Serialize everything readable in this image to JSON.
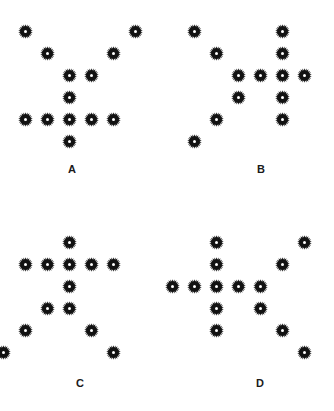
{
  "figure": {
    "background_color": "#ffffff",
    "marker_color": "#121212",
    "marker_center_color": "#ffffff",
    "marker_icon_name": "starburst-marker-icon",
    "width": 334,
    "height": 411,
    "grid_spacing": 22,
    "marker_size": 15
  },
  "chart_data": {
    "type": "scatter",
    "title": "",
    "xlabel": "",
    "ylabel": "",
    "grid": false,
    "legend": null,
    "note": "Four panels of starburst markers arranged on a regular grid; each panel forms an arrow/cross-like figure. Coordinates are grid column/row indices (col increases rightward, row increases downward).",
    "panels": [
      {
        "label": "A",
        "origin": {
          "x": 25,
          "y": 31
        },
        "spacing": 22,
        "label_pos": {
          "x": 72,
          "y": 163
        },
        "points": [
          {
            "col": 0,
            "row": 0
          },
          {
            "col": 5,
            "row": 0
          },
          {
            "col": 1,
            "row": 1
          },
          {
            "col": 4,
            "row": 1
          },
          {
            "col": 2,
            "row": 2
          },
          {
            "col": 3,
            "row": 2
          },
          {
            "col": 2,
            "row": 3
          },
          {
            "col": 0,
            "row": 4
          },
          {
            "col": 1,
            "row": 4
          },
          {
            "col": 2,
            "row": 4
          },
          {
            "col": 3,
            "row": 4
          },
          {
            "col": 4,
            "row": 4
          },
          {
            "col": 2,
            "row": 5
          }
        ]
      },
      {
        "label": "B",
        "origin": {
          "x": 194,
          "y": 31
        },
        "spacing": 22,
        "label_pos": {
          "x": 261,
          "y": 163
        },
        "points": [
          {
            "col": 0,
            "row": 0
          },
          {
            "col": 4,
            "row": 0
          },
          {
            "col": 1,
            "row": 1
          },
          {
            "col": 4,
            "row": 1
          },
          {
            "col": 2,
            "row": 2
          },
          {
            "col": 3,
            "row": 2
          },
          {
            "col": 4,
            "row": 2
          },
          {
            "col": 5,
            "row": 2
          },
          {
            "col": 2,
            "row": 3
          },
          {
            "col": 4,
            "row": 3
          },
          {
            "col": 1,
            "row": 4
          },
          {
            "col": 4,
            "row": 4
          },
          {
            "col": 0,
            "row": 5
          }
        ]
      },
      {
        "label": "C",
        "origin": {
          "x": 25,
          "y": 242
        },
        "spacing": 22,
        "label_pos": {
          "x": 80,
          "y": 377
        },
        "points": [
          {
            "col": 2,
            "row": 0
          },
          {
            "col": 0,
            "row": 1
          },
          {
            "col": 1,
            "row": 1
          },
          {
            "col": 2,
            "row": 1
          },
          {
            "col": 3,
            "row": 1
          },
          {
            "col": 4,
            "row": 1
          },
          {
            "col": 2,
            "row": 2
          },
          {
            "col": 1,
            "row": 3
          },
          {
            "col": 2,
            "row": 3
          },
          {
            "col": 0,
            "row": 4
          },
          {
            "col": 3,
            "row": 4
          },
          {
            "col": -1,
            "row": 5
          },
          {
            "col": 4,
            "row": 5
          }
        ]
      },
      {
        "label": "D",
        "origin": {
          "x": 194,
          "y": 242
        },
        "spacing": 22,
        "label_pos": {
          "x": 260,
          "y": 377
        },
        "points": [
          {
            "col": 1,
            "row": 0
          },
          {
            "col": 5,
            "row": 0
          },
          {
            "col": 1,
            "row": 1
          },
          {
            "col": 4,
            "row": 1
          },
          {
            "col": -1,
            "row": 2
          },
          {
            "col": 0,
            "row": 2
          },
          {
            "col": 1,
            "row": 2
          },
          {
            "col": 2,
            "row": 2
          },
          {
            "col": 3,
            "row": 2
          },
          {
            "col": 1,
            "row": 3
          },
          {
            "col": 3,
            "row": 3
          },
          {
            "col": 1,
            "row": 4
          },
          {
            "col": 4,
            "row": 4
          },
          {
            "col": 5,
            "row": 5
          }
        ]
      }
    ]
  }
}
